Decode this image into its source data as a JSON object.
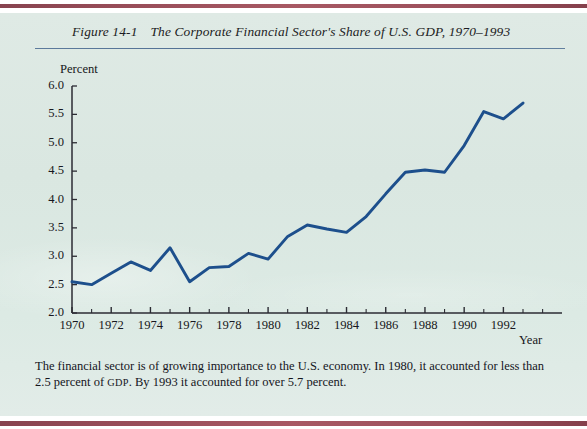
{
  "figure": {
    "number": "Figure 14-1",
    "title": "The Corporate Financial Sector's Share of U.S. GDP, 1970–1993"
  },
  "caption": {
    "part1": "The financial sector is of growing importance to the U.S. economy. In 1980, it accounted for less than 2.5 percent of ",
    "smallcaps": "GDP",
    "part2": ". By 1993 it accounted for over 5.7 percent."
  },
  "colors": {
    "paper": "#dce8e3",
    "line": "#1d4f8c",
    "rule": "#4d6c91",
    "axis": "#2b2b33",
    "scan_band": "#8d3c49"
  },
  "chart_data": {
    "type": "line",
    "title": "The Corporate Financial Sector's Share of U.S. GDP, 1970–1993",
    "xlabel": "Year",
    "ylabel": "Percent",
    "xlim": [
      1970,
      1993
    ],
    "ylim": [
      2.0,
      6.0
    ],
    "grid": false,
    "legend": false,
    "ytick_labels": [
      "6.0",
      "5.5",
      "5.0",
      "4.5",
      "4.0",
      "3.5",
      "3.0",
      "2.5",
      "2.0"
    ],
    "ytick_values": [
      6.0,
      5.5,
      5.0,
      4.5,
      4.0,
      3.5,
      3.0,
      2.5,
      2.0
    ],
    "xtick_labels": [
      "1970",
      "1972",
      "1974",
      "1976",
      "1978",
      "1980",
      "1982",
      "1984",
      "1986",
      "1988",
      "1990",
      "1992"
    ],
    "xtick_values": [
      1970,
      1972,
      1974,
      1976,
      1978,
      1980,
      1982,
      1984,
      1986,
      1988,
      1990,
      1992
    ],
    "x": [
      1970,
      1971,
      1972,
      1973,
      1974,
      1975,
      1976,
      1977,
      1978,
      1979,
      1980,
      1981,
      1982,
      1983,
      1984,
      1985,
      1986,
      1987,
      1988,
      1989,
      1990,
      1991,
      1992,
      1993
    ],
    "values": [
      2.55,
      2.5,
      2.7,
      2.9,
      2.75,
      3.15,
      2.55,
      2.8,
      2.82,
      3.05,
      2.95,
      3.35,
      3.55,
      3.48,
      3.42,
      3.7,
      4.1,
      4.48,
      4.52,
      4.48,
      4.95,
      5.55,
      5.42,
      5.7
    ],
    "series_name": "Corporate financial sector share of U.S. GDP (percent)"
  }
}
